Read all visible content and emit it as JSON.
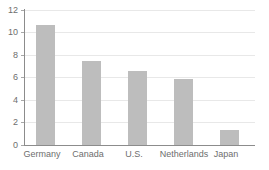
{
  "chart_data": {
    "type": "bar",
    "title": "",
    "subtitle": "",
    "xlabel": "",
    "ylabel": "",
    "categories": [
      "Germany",
      "Canada",
      "U.S.",
      "Netherlands",
      "Japan"
    ],
    "values": [
      10.7,
      7.5,
      6.6,
      5.9,
      1.35
    ],
    "series": [
      {
        "name": "",
        "values": [
          10.7,
          7.5,
          6.6,
          5.9,
          1.35
        ]
      }
    ],
    "ylim": [
      0,
      12
    ],
    "yticks": [
      0,
      2,
      4,
      6,
      8,
      10,
      12
    ],
    "ytick_labels": [
      "0",
      "2",
      "4",
      "6",
      "8",
      "10",
      "12"
    ],
    "xtick_labels": [
      "Germany",
      "Canada",
      "U.S.",
      "Netherlands",
      "Japan"
    ],
    "grid": true,
    "grid_axis": "y",
    "legend": false,
    "legend_position": "none",
    "annotations": [],
    "colors": {
      "bar_fill": "#bdbdbd",
      "gridline": "#e8e8e8",
      "axis_line": "#8c8c8c",
      "tick_label": "#6e6e6e",
      "background": "#ffffff"
    }
  }
}
